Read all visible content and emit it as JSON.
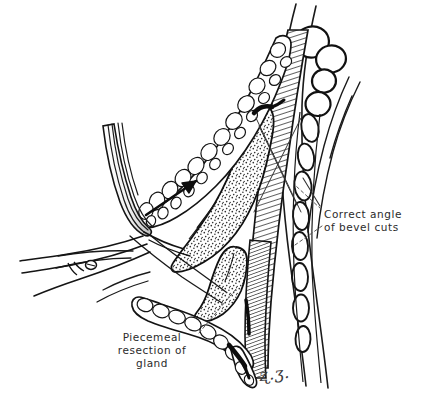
{
  "figure": {
    "domain": "medical-surgical-illustration",
    "width": 426,
    "height": 411,
    "background_color": "#ffffff",
    "ink_color": "#1a1a1a",
    "text_color": "#2b2b2b",
    "signature": "ʐ.ʒ."
  },
  "annotations": [
    {
      "id": "bevel",
      "name": "correct-angle-of-bevel-cuts",
      "lines": [
        "Correct angle",
        "of bevel cuts"
      ],
      "x": 324,
      "y": 208,
      "align": "left",
      "leader_lines": 2
    },
    {
      "id": "piecemeal",
      "name": "piecemeal-resection-of-gland",
      "lines": [
        "Piecemeal",
        "resection of",
        "gland"
      ],
      "x": 104,
      "y": 331,
      "align": "center",
      "leader_lines": 1
    }
  ],
  "anatomy": {
    "tracheal_rings_cut_ends": 4,
    "tracheal_ring_chain_segments": 7,
    "hatched_muscle_band": "strap muscle / sternothyroid, diagonal line hatching",
    "stippled_tissue": "thyroid gland parenchyma, stipple texture",
    "lobulated_tissue": "fascia and fatty lobules, bubbly outline texture",
    "instrument": "retractor blade, upper left, curving down and left",
    "instrument_detail": "hinge screw on blade",
    "direction_arrow": "arrow pointing up and to the right along dissection plane"
  },
  "colors": {
    "ink": "#1a1a1a",
    "hatch": "#2a2a2a",
    "stipple": "#333333",
    "paper": "#ffffff",
    "leader": "#555555"
  }
}
